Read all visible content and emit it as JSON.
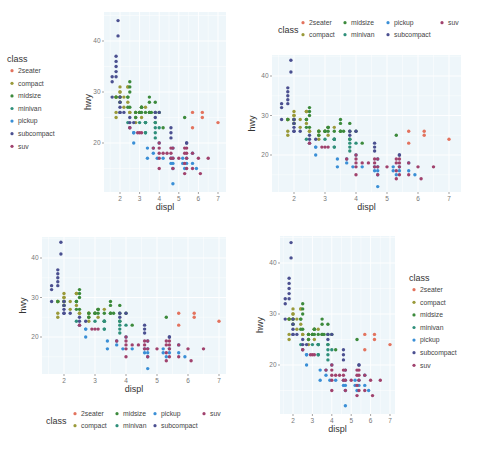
{
  "chart_data": {
    "type": "scatter",
    "title": "",
    "xlabel": "displ",
    "ylabel": "hwy",
    "xlim": [
      1.6,
      7.0
    ],
    "ylim": [
      12,
      44
    ],
    "x_ticks": [
      2,
      3,
      4,
      5,
      6,
      7
    ],
    "y_ticks": [
      20,
      30,
      40
    ],
    "grid": true,
    "legend_title": "class",
    "panel_background": "#eef6fa",
    "legend_positions": [
      "left",
      "top",
      "bottom",
      "right"
    ],
    "series": [
      {
        "name": "2seater",
        "color": "#e3735e",
        "points": [
          [
            5.7,
            26
          ],
          [
            5.7,
            23
          ],
          [
            6.2,
            26
          ],
          [
            6.2,
            25
          ],
          [
            7.0,
            24
          ]
        ]
      },
      {
        "name": "compact",
        "color": "#9a9a3a",
        "points": [
          [
            1.8,
            29
          ],
          [
            1.8,
            29
          ],
          [
            2.0,
            31
          ],
          [
            2.0,
            30
          ],
          [
            2.8,
            26
          ],
          [
            2.8,
            26
          ],
          [
            3.1,
            27
          ],
          [
            1.8,
            26
          ],
          [
            1.8,
            25
          ],
          [
            2.0,
            28
          ],
          [
            2.0,
            29
          ],
          [
            2.8,
            25
          ],
          [
            3.1,
            25
          ],
          [
            2.2,
            27
          ],
          [
            2.2,
            29
          ],
          [
            2.4,
            31
          ],
          [
            2.4,
            31
          ],
          [
            3.0,
            26
          ],
          [
            3.3,
            27
          ],
          [
            1.8,
            29
          ],
          [
            2.0,
            29
          ],
          [
            2.5,
            26
          ],
          [
            2.5,
            26
          ],
          [
            2.8,
            24
          ],
          [
            2.0,
            30
          ],
          [
            2.4,
            28
          ]
        ]
      },
      {
        "name": "midsize",
        "color": "#3c8a3c",
        "points": [
          [
            2.8,
            26
          ],
          [
            3.1,
            27
          ],
          [
            4.2,
            23
          ],
          [
            2.4,
            29
          ],
          [
            2.4,
            27
          ],
          [
            3.1,
            26
          ],
          [
            3.5,
            26
          ],
          [
            3.6,
            26
          ],
          [
            2.5,
            27
          ],
          [
            2.5,
            30
          ],
          [
            3.3,
            26
          ],
          [
            3.5,
            29
          ],
          [
            3.8,
            26
          ],
          [
            3.8,
            24
          ],
          [
            4.0,
            26
          ],
          [
            5.3,
            25
          ],
          [
            3.0,
            26
          ],
          [
            3.5,
            28
          ],
          [
            3.8,
            28
          ],
          [
            2.0,
            29
          ],
          [
            2.0,
            28
          ],
          [
            2.5,
            32
          ],
          [
            3.3,
            24
          ],
          [
            2.4,
            29
          ],
          [
            2.8,
            25
          ],
          [
            3.0,
            26
          ],
          [
            3.5,
            26
          ],
          [
            1.8,
            29
          ],
          [
            3.1,
            27
          ],
          [
            2.5,
            31
          ]
        ]
      },
      {
        "name": "minivan",
        "color": "#2f8f7a",
        "points": [
          [
            2.4,
            24
          ],
          [
            3.0,
            24
          ],
          [
            3.3,
            22
          ],
          [
            3.3,
            22
          ],
          [
            3.3,
            24
          ],
          [
            3.8,
            22
          ],
          [
            3.8,
            21
          ],
          [
            3.8,
            24
          ],
          [
            4.0,
            23
          ],
          [
            3.8,
            23
          ],
          [
            3.3,
            24
          ]
        ]
      },
      {
        "name": "pickup",
        "color": "#3a8fd6",
        "points": [
          [
            2.7,
            20
          ],
          [
            2.7,
            22
          ],
          [
            3.4,
            19
          ],
          [
            3.4,
            17
          ],
          [
            3.7,
            18
          ],
          [
            3.7,
            19
          ],
          [
            3.9,
            17
          ],
          [
            4.7,
            16
          ],
          [
            4.7,
            17
          ],
          [
            5.2,
            17
          ],
          [
            5.2,
            16
          ],
          [
            5.7,
            18
          ],
          [
            5.9,
            15
          ],
          [
            4.7,
            19
          ],
          [
            4.7,
            12
          ],
          [
            4.0,
            20
          ],
          [
            4.2,
            17
          ],
          [
            4.6,
            17
          ],
          [
            4.6,
            16
          ],
          [
            5.3,
            15
          ],
          [
            5.4,
            17
          ],
          [
            5.4,
            16
          ],
          [
            4.7,
            15
          ],
          [
            5.7,
            16
          ],
          [
            2.7,
            22
          ]
        ]
      },
      {
        "name": "subcompact",
        "color": "#4b5090",
        "points": [
          [
            1.6,
            33
          ],
          [
            1.6,
            32
          ],
          [
            1.6,
            29
          ],
          [
            1.8,
            34
          ],
          [
            1.8,
            35
          ],
          [
            1.8,
            36
          ],
          [
            1.8,
            37
          ],
          [
            1.9,
            44
          ],
          [
            1.9,
            41
          ],
          [
            2.0,
            29
          ],
          [
            2.0,
            26
          ],
          [
            2.2,
            26
          ],
          [
            2.5,
            23
          ],
          [
            2.5,
            24
          ],
          [
            3.8,
            26
          ],
          [
            4.0,
            26
          ],
          [
            4.6,
            23
          ],
          [
            4.6,
            22
          ],
          [
            5.4,
            20
          ],
          [
            1.8,
            33
          ],
          [
            2.0,
            28
          ],
          [
            2.0,
            27
          ],
          [
            2.5,
            25
          ],
          [
            2.7,
            24
          ],
          [
            2.0,
            26
          ],
          [
            3.8,
            25
          ],
          [
            4.6,
            21
          ],
          [
            5.4,
            20
          ]
        ]
      },
      {
        "name": "suv",
        "color": "#a0426d",
        "points": [
          [
            3.0,
            22
          ],
          [
            3.7,
            19
          ],
          [
            4.0,
            15
          ],
          [
            4.0,
            17
          ],
          [
            4.0,
            20
          ],
          [
            4.6,
            19
          ],
          [
            4.6,
            17
          ],
          [
            4.7,
            15
          ],
          [
            5.4,
            17
          ],
          [
            5.4,
            18
          ],
          [
            5.3,
            19
          ],
          [
            5.3,
            18
          ],
          [
            5.7,
            18
          ],
          [
            6.0,
            17
          ],
          [
            6.1,
            14
          ],
          [
            6.5,
            17
          ],
          [
            2.5,
            23
          ],
          [
            2.9,
            22
          ],
          [
            3.1,
            22
          ],
          [
            4.2,
            18
          ],
          [
            4.4,
            18
          ],
          [
            4.7,
            19
          ],
          [
            5.3,
            16
          ],
          [
            5.3,
            14
          ],
          [
            5.7,
            15
          ],
          [
            4.0,
            18
          ],
          [
            4.6,
            18
          ],
          [
            5.4,
            15
          ],
          [
            4.0,
            19
          ],
          [
            4.7,
            17
          ],
          [
            5.0,
            17
          ],
          [
            5.4,
            19
          ]
        ]
      }
    ]
  },
  "panels": [
    {
      "id": "left-legend",
      "legend_title": "class",
      "xlabel": "displ",
      "ylabel": "hwy"
    },
    {
      "id": "top-legend",
      "legend_title": "class",
      "xlabel": "displ",
      "ylabel": "hwy"
    },
    {
      "id": "bottom-legend",
      "legend_title": "class",
      "xlabel": "displ",
      "ylabel": "hwy"
    },
    {
      "id": "right-legend",
      "legend_title": "class",
      "xlabel": "displ",
      "ylabel": "hwy"
    }
  ]
}
